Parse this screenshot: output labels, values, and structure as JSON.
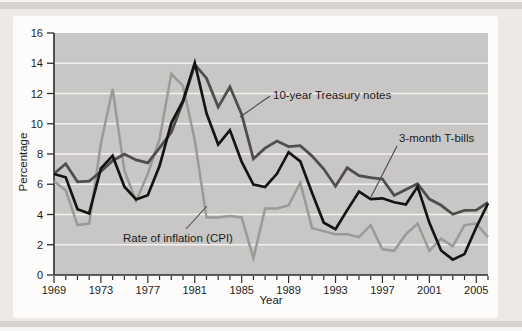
{
  "colors": {
    "page_background": "#ece9e6",
    "accent_bar": "#d6d2cf",
    "card_background": "#fdfcfb",
    "plot_background": "#c9c7c5",
    "gridline": "#f3f1ef",
    "axis": "#2e2c2b",
    "text": "#1c1b1a",
    "leader_line": "#4b4948"
  },
  "chart_data": {
    "type": "line",
    "title": "",
    "xlabel": "Year",
    "ylabel": "Percentage",
    "x_range": [
      1969,
      2006
    ],
    "ylim": [
      0,
      16
    ],
    "y_ticks": [
      0,
      2,
      4,
      6,
      8,
      10,
      12,
      14,
      16
    ],
    "x_tick_labels": [
      "1969",
      "1973",
      "1977",
      "1981",
      "1985",
      "1989",
      "1993",
      "1997",
      "2001",
      "2005"
    ],
    "grid": "horizontal",
    "legend_position": "inline-annotations-with-leader-lines",
    "x": [
      1969,
      1970,
      1971,
      1972,
      1973,
      1974,
      1975,
      1976,
      1977,
      1978,
      1979,
      1980,
      1981,
      1982,
      1983,
      1984,
      1985,
      1986,
      1987,
      1988,
      1989,
      1990,
      1991,
      1992,
      1993,
      1994,
      1995,
      1996,
      1997,
      1998,
      1999,
      2000,
      2001,
      2002,
      2003,
      2004,
      2005,
      2006
    ],
    "series": [
      {
        "name": "10-year Treasury notes",
        "color": "#504e4d",
        "values": [
          6.7,
          7.35,
          6.16,
          6.21,
          6.84,
          7.56,
          7.99,
          7.61,
          7.42,
          8.41,
          9.44,
          11.43,
          13.92,
          13.01,
          11.1,
          12.44,
          10.62,
          7.68,
          8.39,
          8.85,
          8.49,
          8.55,
          7.86,
          7.01,
          5.87,
          7.09,
          6.57,
          6.44,
          6.35,
          5.26,
          5.65,
          6.03,
          5.02,
          4.61,
          4.01,
          4.27,
          4.29,
          4.8
        ]
      },
      {
        "name": "3-month T-bills",
        "color": "#151413",
        "values": [
          6.68,
          6.46,
          4.35,
          4.07,
          7.04,
          7.89,
          5.84,
          4.99,
          5.27,
          7.22,
          10.04,
          11.51,
          14.03,
          10.69,
          8.63,
          9.58,
          7.48,
          5.98,
          5.82,
          6.69,
          8.12,
          7.51,
          5.42,
          3.45,
          3.02,
          4.29,
          5.51,
          5.02,
          5.07,
          4.81,
          4.66,
          5.85,
          3.45,
          1.62,
          1.02,
          1.38,
          3.16,
          4.73
        ]
      },
      {
        "name": "Rate of inflation (CPI)",
        "color": "#9b9a98",
        "values": [
          6.2,
          5.6,
          3.3,
          3.4,
          8.7,
          12.3,
          6.9,
          4.9,
          6.7,
          9.0,
          13.3,
          12.5,
          8.9,
          3.8,
          3.8,
          3.9,
          3.8,
          1.1,
          4.4,
          4.4,
          4.6,
          6.1,
          3.1,
          2.9,
          2.7,
          2.7,
          2.5,
          3.3,
          1.7,
          1.6,
          2.7,
          3.4,
          1.6,
          2.4,
          1.9,
          3.3,
          3.4,
          2.5
        ]
      }
    ]
  }
}
